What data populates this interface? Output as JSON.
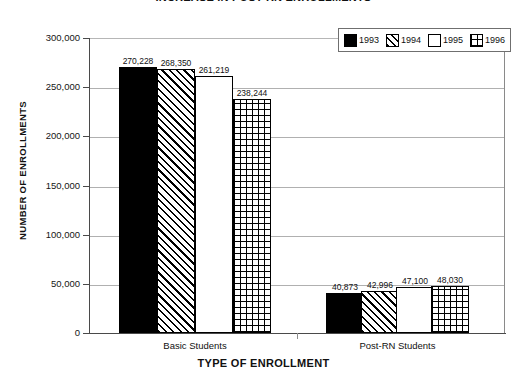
{
  "chart_data": {
    "type": "bar",
    "title": "INCREASE IN POST-RN ENROLLMENTS",
    "xlabel": "TYPE OF ENROLLMENT",
    "ylabel": "NUMBER OF ENROLLMENTS",
    "categories": [
      "Basic Students",
      "Post-RN Students"
    ],
    "ylim": [
      0,
      300000
    ],
    "yticks": [
      0,
      50000,
      100000,
      150000,
      200000,
      250000,
      300000
    ],
    "ytick_labels": [
      "0",
      "50,000",
      "100,000",
      "150,000",
      "200,000",
      "250,000",
      "300,000"
    ],
    "grid": true,
    "legend_position": "top-right",
    "series": [
      {
        "name": "1993",
        "pattern": "solid",
        "values": [
          270228,
          40873
        ],
        "value_labels": [
          "270,228",
          "40,873"
        ]
      },
      {
        "name": "1994",
        "pattern": "diag",
        "values": [
          268350,
          42996
        ],
        "value_labels": [
          "268,350",
          "42,996"
        ]
      },
      {
        "name": "1995",
        "pattern": "empty",
        "values": [
          261219,
          47100
        ],
        "value_labels": [
          "261,219",
          "47,100"
        ]
      },
      {
        "name": "1996",
        "pattern": "grid",
        "values": [
          238244,
          48030
        ],
        "value_labels": [
          "238,244",
          "48,030"
        ]
      }
    ],
    "colors": {
      "axis": "#4a4a4a",
      "gridline": "#b0b0b0",
      "bar_outline": "#000000",
      "text": "#111111",
      "background": "#ffffff"
    }
  }
}
